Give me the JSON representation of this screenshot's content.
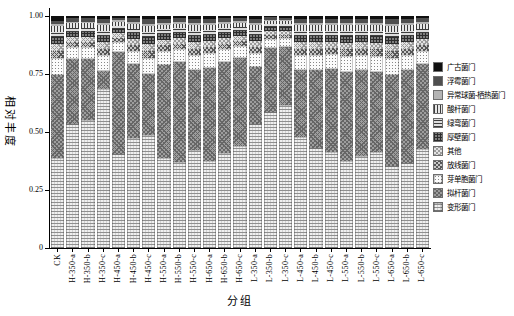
{
  "figure": {
    "width": 514,
    "height": 316,
    "background": "#ffffff"
  },
  "y_axis": {
    "title": "相对丰度",
    "ticks": [
      {
        "label": "1.00",
        "value": 1.0
      },
      {
        "label": "0.75",
        "value": 0.75
      },
      {
        "label": "0.50",
        "value": 0.5
      },
      {
        "label": "0.25",
        "value": 0.25
      },
      {
        "label": "0",
        "value": 0
      }
    ]
  },
  "x_axis": {
    "title": "分组"
  },
  "chart_data": {
    "type": "bar",
    "stacked": true,
    "orientation": "vertical",
    "title": "",
    "xlabel": "分组",
    "ylabel": "相对丰度",
    "ylim": [
      0,
      1
    ],
    "grid": false,
    "legend_position": "right",
    "legend_top_to_bottom": [
      "广古菌门",
      "浮霉菌门",
      "异常球菌-栖热菌门",
      "酸杆菌门",
      "绿弯菌门",
      "厚壁菌门",
      "其他",
      "放线菌门",
      "芽单胞菌门",
      "拟杆菌门",
      "变形菌门"
    ],
    "categories": [
      "CK",
      "H-350-a",
      "H-350-b",
      "H-350-c",
      "H-450-a",
      "H-450-b",
      "H-450-c",
      "H-550-a",
      "H-550-b",
      "H-550-c",
      "H-650-a",
      "H-650-b",
      "H-650-c",
      "L-350-a",
      "L-350-b",
      "L-350-c",
      "L-450-a",
      "L-450-b",
      "L-450-c",
      "L-550-a",
      "L-550-b",
      "L-550-c",
      "L-650-a",
      "L-650-b",
      "L-650-c"
    ],
    "series": [
      {
        "name": "变形菌门",
        "pattern": "light-horizontal-grid",
        "color": "#efefef",
        "values": [
          0.39,
          0.535,
          0.55,
          0.685,
          0.405,
          0.475,
          0.487,
          0.388,
          0.371,
          0.422,
          0.375,
          0.409,
          0.44,
          0.534,
          0.586,
          0.616,
          0.478,
          0.431,
          0.414,
          0.375,
          0.397,
          0.414,
          0.353,
          0.366,
          0.427
        ]
      },
      {
        "name": "拟杆菌门",
        "pattern": "dark-diagonal-crosshatch",
        "color": "#9d9d9d",
        "values": [
          0.355,
          0.28,
          0.265,
          0.08,
          0.44,
          0.318,
          0.263,
          0.401,
          0.431,
          0.345,
          0.401,
          0.393,
          0.379,
          0.246,
          0.276,
          0.25,
          0.289,
          0.336,
          0.357,
          0.384,
          0.37,
          0.345,
          0.393,
          0.401,
          0.366
        ]
      },
      {
        "name": "芽单胞菌门",
        "pattern": "fine-dots-on-white",
        "color": "#fbfbfb",
        "values": [
          0.073,
          0.052,
          0.052,
          0.066,
          0.043,
          0.058,
          0.07,
          0.059,
          0.055,
          0.065,
          0.063,
          0.055,
          0.051,
          0.062,
          0.039,
          0.038,
          0.065,
          0.065,
          0.064,
          0.068,
          0.065,
          0.068,
          0.071,
          0.065,
          0.058
        ]
      },
      {
        "name": "放线菌门",
        "pattern": "gray-diagonal-crosshatch",
        "color": "#c6c6c6",
        "values": [
          0.032,
          0.022,
          0.022,
          0.028,
          0.019,
          0.025,
          0.03,
          0.025,
          0.024,
          0.028,
          0.027,
          0.024,
          0.022,
          0.026,
          0.017,
          0.016,
          0.028,
          0.028,
          0.027,
          0.029,
          0.028,
          0.029,
          0.031,
          0.028,
          0.025
        ]
      },
      {
        "name": "其他",
        "pattern": "light-diagonal-crosshatch",
        "color": "#e4e4e4",
        "values": [
          0.03,
          0.022,
          0.022,
          0.028,
          0.019,
          0.025,
          0.03,
          0.025,
          0.024,
          0.028,
          0.027,
          0.024,
          0.022,
          0.026,
          0.017,
          0.016,
          0.028,
          0.028,
          0.027,
          0.029,
          0.028,
          0.029,
          0.03,
          0.028,
          0.025
        ]
      },
      {
        "name": "厚壁菌门",
        "pattern": "dark-grid",
        "color": "#7d7d7d",
        "values": [
          0.03,
          0.022,
          0.022,
          0.028,
          0.019,
          0.025,
          0.03,
          0.025,
          0.024,
          0.028,
          0.027,
          0.024,
          0.022,
          0.026,
          0.017,
          0.016,
          0.028,
          0.028,
          0.027,
          0.029,
          0.028,
          0.029,
          0.03,
          0.028,
          0.025
        ]
      },
      {
        "name": "绿弯菌门",
        "pattern": "horizontal-stripes",
        "color": "#dedede",
        "values": [
          0.022,
          0.017,
          0.017,
          0.021,
          0.014,
          0.019,
          0.023,
          0.019,
          0.018,
          0.021,
          0.02,
          0.018,
          0.016,
          0.02,
          0.012,
          0.012,
          0.021,
          0.021,
          0.021,
          0.022,
          0.021,
          0.022,
          0.023,
          0.021,
          0.019
        ]
      },
      {
        "name": "酸杆菌门",
        "pattern": "vertical-stripes",
        "color": "#e8e8e8",
        "values": [
          0.025,
          0.019,
          0.019,
          0.024,
          0.016,
          0.021,
          0.025,
          0.021,
          0.02,
          0.023,
          0.022,
          0.02,
          0.018,
          0.022,
          0.014,
          0.013,
          0.023,
          0.023,
          0.023,
          0.024,
          0.023,
          0.024,
          0.026,
          0.023,
          0.021
        ]
      },
      {
        "name": "异常球菌-栖热菌门",
        "pattern": "solid-light-gray",
        "color": "#b3b3b3",
        "values": [
          0.008,
          0.007,
          0.007,
          0.009,
          0.006,
          0.008,
          0.009,
          0.008,
          0.007,
          0.009,
          0.008,
          0.007,
          0.007,
          0.008,
          0.005,
          0.005,
          0.009,
          0.009,
          0.009,
          0.009,
          0.009,
          0.009,
          0.01,
          0.009,
          0.008
        ]
      },
      {
        "name": "浮霉菌门",
        "pattern": "solid-dark-gray",
        "color": "#4f4f4f",
        "values": [
          0.015,
          0.015,
          0.015,
          0.019,
          0.012,
          0.017,
          0.02,
          0.017,
          0.016,
          0.019,
          0.018,
          0.016,
          0.014,
          0.018,
          0.011,
          0.011,
          0.019,
          0.019,
          0.019,
          0.019,
          0.019,
          0.019,
          0.02,
          0.019,
          0.017
        ]
      },
      {
        "name": "广古菌门",
        "pattern": "solid-black",
        "color": "#101010",
        "values": [
          0.02,
          0.009,
          0.009,
          0.012,
          0.007,
          0.009,
          0.013,
          0.012,
          0.01,
          0.012,
          0.012,
          0.01,
          0.009,
          0.012,
          0.006,
          0.007,
          0.012,
          0.012,
          0.012,
          0.012,
          0.012,
          0.012,
          0.013,
          0.012,
          0.009
        ]
      }
    ]
  }
}
